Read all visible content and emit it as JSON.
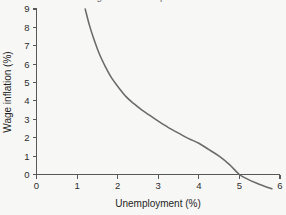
{
  "figure": {
    "name": "phillips-curve-figure",
    "background_color": "#f7f7f5",
    "clipped_top_title": "Figure: the Phillips curve",
    "axis_color": "#58585a",
    "text_color": "#1e1e1e"
  },
  "chart_data": {
    "type": "line",
    "title": "",
    "xlabel": "Unemployment (%)",
    "ylabel": "Wage inflation (%)",
    "xlim": [
      0,
      6
    ],
    "ylim": [
      0,
      9
    ],
    "grid": false,
    "legend": null,
    "series": [
      {
        "name": "Phillips curve",
        "color": "#6a6a6a",
        "x": [
          1.2,
          1.3,
          1.4,
          1.55,
          1.7,
          1.85,
          2.0,
          2.2,
          2.4,
          2.6,
          2.8,
          3.0,
          3.25,
          3.5,
          3.75,
          4.0,
          4.25,
          4.5,
          4.75,
          5.0,
          5.2,
          5.4,
          5.6,
          5.8
        ],
        "values": [
          9.0,
          8.15,
          7.45,
          6.55,
          5.85,
          5.25,
          4.8,
          4.25,
          3.85,
          3.5,
          3.2,
          2.9,
          2.55,
          2.25,
          1.95,
          1.7,
          1.35,
          1.0,
          0.55,
          0.0,
          -0.25,
          -0.45,
          -0.62,
          -0.78
        ]
      }
    ],
    "x_ticks": [
      0,
      1,
      2,
      3,
      4,
      5,
      6
    ],
    "x_tick_labels": [
      "0",
      "1",
      "2",
      "3",
      "4",
      "5",
      "6"
    ],
    "y_ticks": [
      0,
      1,
      2,
      3,
      4,
      5,
      6,
      7,
      8,
      9
    ],
    "y_tick_labels": [
      "0",
      "1",
      "2",
      "3",
      "4",
      "5",
      "6",
      "7",
      "8",
      "9"
    ],
    "annotations": [
      {
        "name": "zero-inflation-crossing",
        "x": 5.0,
        "y": 0.0,
        "text": ""
      }
    ]
  }
}
